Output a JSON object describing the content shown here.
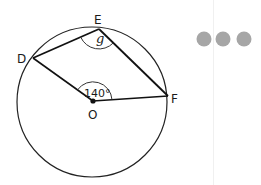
{
  "diagram": {
    "points": {
      "D": {
        "label": "D",
        "x": 33,
        "y": 58
      },
      "E": {
        "label": "E",
        "x": 99,
        "y": 29
      },
      "F": {
        "label": "F",
        "x": 168,
        "y": 96
      },
      "O": {
        "label": "O",
        "x": 93,
        "y": 101
      }
    },
    "angles": {
      "inscribed_label": "g",
      "central_label": "140°"
    },
    "circle": {
      "cx": 92,
      "cy": 102,
      "r": 75
    }
  },
  "menu": {
    "icon": "more-dots-icon",
    "dot_color": "#a6a6a6"
  }
}
